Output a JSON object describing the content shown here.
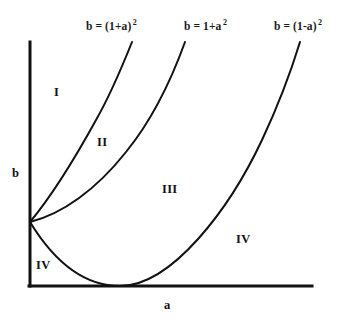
{
  "figure": {
    "background_color": "#ffffff",
    "ink_color": "#111111"
  },
  "axes": {
    "x_label": "a",
    "y_label": "b",
    "x_label_pos": {
      "x": 164,
      "y": 298
    },
    "y_label_pos": {
      "x": 12,
      "y": 166
    },
    "origin": {
      "x": 30,
      "y": 286
    },
    "x_axis_end": {
      "x": 312,
      "y": 286
    },
    "y_axis_top": {
      "x": 30,
      "y": 42
    },
    "line_width": 3
  },
  "curves": [
    {
      "id": "curve-1",
      "label_text": "b = (1+a)",
      "label_exponent": "2",
      "label_pos": {
        "x": 86,
        "y": 18
      },
      "formula": "b = (1+a)^2",
      "path": "M 30,222 C 50,198 74,160 96,120 C 112,92 124,62 132,42"
    },
    {
      "id": "curve-2",
      "label_text": "b = 1+a",
      "label_exponent": "2",
      "label_pos": {
        "x": 184,
        "y": 18
      },
      "formula": "b = 1+a^2",
      "path": "M 30,222 C 62,214 96,190 126,152 C 152,120 172,78 185,42"
    },
    {
      "id": "curve-3",
      "label_text": "b = (1-a)",
      "label_exponent": "2",
      "label_pos": {
        "x": 274,
        "y": 18
      },
      "formula": "b = (1-a)^2",
      "path": "M 30,222 C 52,258 82,286 120,286 C 172,286 230,208 262,140 C 278,106 292,68 300,42"
    }
  ],
  "regions": [
    {
      "id": "region-1",
      "label": "I",
      "x": 54,
      "y": 85
    },
    {
      "id": "region-2",
      "label": "II",
      "x": 97,
      "y": 135
    },
    {
      "id": "region-3",
      "label": "III",
      "x": 162,
      "y": 182
    },
    {
      "id": "region-4a",
      "label": "IV",
      "x": 236,
      "y": 232
    },
    {
      "id": "region-4b",
      "label": "IV",
      "x": 36,
      "y": 258
    }
  ]
}
